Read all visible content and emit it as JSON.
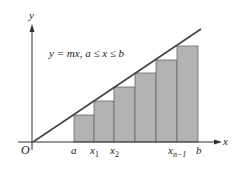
{
  "diagram": {
    "equation": "y = mx,  a ≤ x ≤ b",
    "axis_labels": {
      "x": "x",
      "y": "y",
      "origin": "O"
    },
    "tick_labels": [
      {
        "id": "a",
        "text": "a",
        "sub": ""
      },
      {
        "id": "x1",
        "text": "x",
        "sub": "1"
      },
      {
        "id": "x2",
        "text": "x",
        "sub": "2"
      },
      {
        "id": "xn1",
        "text": "x",
        "sub": "n−1"
      },
      {
        "id": "b",
        "text": "b",
        "sub": ""
      }
    ],
    "colors": {
      "bar_fill": "#b3b3b3",
      "line": "#444444",
      "axis": "#333333"
    },
    "bars": [
      {
        "x0": 74,
        "x1": 94,
        "top": 115
      },
      {
        "x0": 94,
        "x1": 114,
        "top": 101
      },
      {
        "x0": 114,
        "x1": 135,
        "top": 87
      },
      {
        "x0": 135,
        "x1": 156,
        "top": 73
      },
      {
        "x0": 156,
        "x1": 177,
        "top": 60
      },
      {
        "x0": 177,
        "x1": 198,
        "top": 46
      }
    ]
  }
}
